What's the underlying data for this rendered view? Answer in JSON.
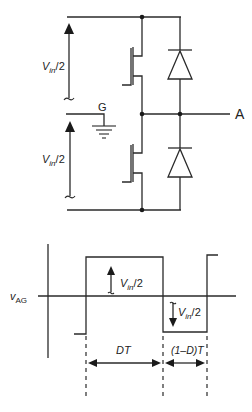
{
  "circuit": {
    "source_upper_label": {
      "main": "V",
      "sub": "in",
      "tail": "/2"
    },
    "source_lower_label": {
      "main": "V",
      "sub": "in",
      "tail": "/2"
    },
    "ground_label": "G",
    "output_node_label": "A",
    "components": [
      "upper-mosfet",
      "lower-mosfet",
      "upper-diode",
      "lower-diode",
      "ground-symbol"
    ]
  },
  "waveform": {
    "y_axis_label": {
      "main": "v",
      "sub": "AG"
    },
    "positive_level_label": {
      "main": "V",
      "sub": "in",
      "tail": "/2"
    },
    "negative_level_label": {
      "main": "V",
      "sub": "in",
      "tail": "/2"
    },
    "interval_on_label": "DT",
    "interval_off_label": "(1–D)T",
    "levels": {
      "high": "+Vin/2",
      "low": "-Vin/2"
    }
  },
  "colors": {
    "line": "#2a2a2a",
    "background": "#ffffff"
  }
}
